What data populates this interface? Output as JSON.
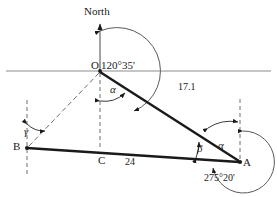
{
  "figure": {
    "type": "surveying-bearing-triangle-diagram",
    "background_color": "#ffffff",
    "ink_color": "#1a1a1a",
    "guide_color": "#8c8c8c",
    "labels": {
      "north": "North",
      "point_o": "O",
      "point_a": "A",
      "point_b": "B",
      "point_c": "C",
      "bearing_at_o": "120°35'",
      "bearing_at_a": "275°20'",
      "length_oa": "17.1",
      "length_ba": "24",
      "angle_alpha_at_o": "α",
      "angle_alpha_at_a": "α",
      "angle_beta_at_a": "β",
      "angle_gamma_at_b": "γ"
    },
    "points": {
      "O": {
        "x": 100,
        "y": 71
      },
      "A": {
        "x": 240,
        "y": 162
      },
      "B": {
        "x": 27,
        "y": 148
      },
      "C": {
        "x": 100,
        "y": 153
      }
    },
    "segments": [
      {
        "name": "OA",
        "from": "O",
        "to": "A",
        "style": "solid-bold",
        "length_label": "17.1"
      },
      {
        "name": "BA",
        "from": "B",
        "to": "A",
        "style": "solid-bold",
        "length_label": "24"
      },
      {
        "name": "BO",
        "from": "B",
        "to": "O",
        "style": "dashed"
      }
    ],
    "guides": {
      "horizontal_line_y": 71,
      "north_axis_x": 100,
      "north_axis_top_y": 22,
      "vertical_dashed_at_O": true,
      "vertical_dashed_at_B": true,
      "vertical_dashed_at_A": true
    }
  }
}
